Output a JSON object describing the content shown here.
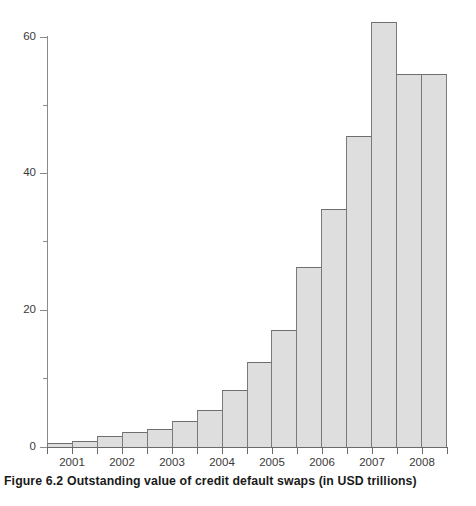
{
  "caption": {
    "figure_number": "Figure 6.2",
    "text": "Outstanding value of credit default swaps (in USD trillions)"
  },
  "chart_data": {
    "type": "bar",
    "title": "Outstanding value of credit default swaps (in USD trillions)",
    "xlabel": "",
    "ylabel": "",
    "ylim": [
      0,
      65
    ],
    "yticks": [
      0,
      20,
      40,
      60
    ],
    "ytick_labels": [
      "0",
      "20",
      "40",
      "60"
    ],
    "yticks_minor": [
      10,
      30,
      50
    ],
    "grid": false,
    "legend": null,
    "xtick_labels": [
      "2001",
      "2002",
      "2003",
      "2004",
      "2005",
      "2006",
      "2007",
      "2008"
    ],
    "categories": [
      "2001 H1",
      "2001 H2",
      "2002 H1",
      "2002 H2",
      "2003 H1",
      "2003 H2",
      "2004 H1",
      "2004 H2",
      "2005 H1",
      "2005 H2",
      "2006 H1",
      "2006 H2",
      "2007 H1",
      "2007 H2",
      "2008 H1",
      "2008 H2"
    ],
    "values": [
      0.6,
      0.9,
      1.6,
      2.2,
      2.7,
      3.8,
      5.4,
      8.4,
      12.4,
      17.1,
      26.3,
      34.9,
      45.5,
      62.2,
      54.6,
      54.6
    ],
    "bar_fill_color": "#dedede",
    "bar_edge_color": "#7a7a7a",
    "axis_color": "#6b6b6b",
    "background_color": "#ffffff"
  }
}
